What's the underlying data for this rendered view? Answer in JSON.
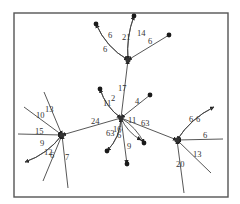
{
  "diagram": {
    "type": "directed-weighted-graph",
    "hubs": [
      {
        "id": "T",
        "name": "top-hub"
      },
      {
        "id": "C",
        "name": "center-hub"
      },
      {
        "id": "L",
        "name": "left-hub"
      },
      {
        "id": "R",
        "name": "right-hub"
      }
    ],
    "leaves": [
      {
        "id": "t1",
        "name": "top-leaf-1"
      },
      {
        "id": "t2",
        "name": "top-leaf-2"
      },
      {
        "id": "t3",
        "name": "top-leaf-3"
      },
      {
        "id": "c1",
        "name": "center-leaf-1"
      },
      {
        "id": "c2",
        "name": "center-leaf-2"
      },
      {
        "id": "c3",
        "name": "center-leaf-3"
      },
      {
        "id": "c4",
        "name": "center-leaf-4"
      },
      {
        "id": "c5",
        "name": "center-leaf-5"
      },
      {
        "id": "c6",
        "name": "center-leaf-6"
      },
      {
        "id": "l1",
        "name": "left-leaf-1"
      },
      {
        "id": "l2",
        "name": "left-leaf-2"
      },
      {
        "id": "l3",
        "name": "left-leaf-3"
      },
      {
        "id": "l4",
        "name": "left-leaf-4"
      },
      {
        "id": "l5",
        "name": "left-leaf-5"
      },
      {
        "id": "l6",
        "name": "left-leaf-6"
      },
      {
        "id": "r1",
        "name": "right-leaf-1"
      },
      {
        "id": "r2",
        "name": "right-leaf-2"
      },
      {
        "id": "r3",
        "name": "right-leaf-3"
      },
      {
        "id": "r4",
        "name": "right-leaf-4"
      }
    ],
    "edges": [
      {
        "from": "T",
        "to": "t1",
        "label": "6"
      },
      {
        "from": "t1",
        "to": "T",
        "label": "6"
      },
      {
        "from": "T",
        "to": "t2",
        "label": "21"
      },
      {
        "from": "t2",
        "to": "T",
        "label": "14"
      },
      {
        "from": "t3",
        "to": "T",
        "label": "6"
      },
      {
        "from": "C",
        "to": "T",
        "label": "17"
      },
      {
        "from": "C",
        "to": "c1",
        "label": "2"
      },
      {
        "from": "c1",
        "to": "C",
        "label": "11"
      },
      {
        "from": "c2",
        "to": "C",
        "label": "4"
      },
      {
        "from": "C",
        "to": "L",
        "label": "24"
      },
      {
        "from": "C",
        "to": "R",
        "label": "11"
      },
      {
        "from": "C",
        "to": "c3",
        "label": "63"
      },
      {
        "from": "C",
        "to": "c3b",
        "label": "63"
      },
      {
        "from": "C",
        "to": "c4",
        "label": "16"
      },
      {
        "from": "c4",
        "to": "C",
        "label": "6"
      },
      {
        "from": "C",
        "to": "c5",
        "label": "9"
      },
      {
        "from": "l1",
        "to": "L",
        "label": "13"
      },
      {
        "from": "l2",
        "to": "L",
        "label": "10"
      },
      {
        "from": "l3",
        "to": "L",
        "label": "15"
      },
      {
        "from": "L",
        "to": "l4",
        "label": "9"
      },
      {
        "from": "l4",
        "to": "L",
        "label": "12"
      },
      {
        "from": "l5",
        "to": "L",
        "label": "6"
      },
      {
        "from": "l6",
        "to": "L",
        "label": "7"
      },
      {
        "from": "R",
        "to": "r1",
        "label": "6"
      },
      {
        "from": "r1",
        "to": "R",
        "label": "6"
      },
      {
        "from": "r2",
        "to": "R",
        "label": "6"
      },
      {
        "from": "r3",
        "to": "R",
        "label": "13"
      },
      {
        "from": "r4",
        "to": "R",
        "label": "20"
      }
    ],
    "labels": [
      "6",
      "6",
      "21",
      "14",
      "6",
      "17",
      "2",
      "11",
      "4",
      "24",
      "63",
      "11",
      "16",
      "6",
      "6",
      "9",
      "13",
      "10",
      "15",
      "9",
      "12",
      "6",
      "7",
      "6",
      "6",
      "6",
      "13",
      "20"
    ]
  }
}
